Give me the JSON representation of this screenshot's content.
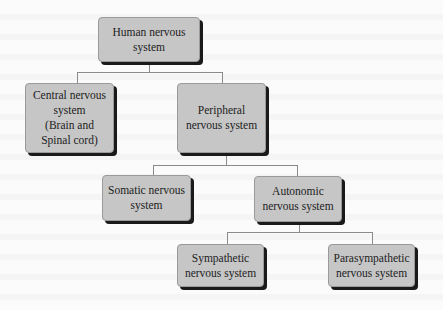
{
  "diagram": {
    "type": "hierarchy",
    "colors": {
      "node_fill": "#c6c6c6",
      "node_shadow": "#1a1a1a",
      "connector": "#8a8a8a",
      "text": "#222222",
      "background": "#fbfbfb"
    },
    "nodes": {
      "human": {
        "label": "Human nervous\nsystem"
      },
      "central": {
        "label": "Central nervous\nsystem\n(Brain and\nSpinal cord)"
      },
      "peripheral": {
        "label": "Peripheral\nnervous system"
      },
      "somatic": {
        "label": "Somatic nervous\nsystem"
      },
      "autonomic": {
        "label": "Autonomic\nnervous system"
      },
      "sympathetic": {
        "label": "Sympathetic\nnervous system"
      },
      "parasympathetic": {
        "label": "Parasympathetic\nnervous system"
      }
    },
    "edges": [
      [
        "human",
        "central"
      ],
      [
        "human",
        "peripheral"
      ],
      [
        "peripheral",
        "somatic"
      ],
      [
        "peripheral",
        "autonomic"
      ],
      [
        "autonomic",
        "sympathetic"
      ],
      [
        "autonomic",
        "parasympathetic"
      ]
    ]
  }
}
